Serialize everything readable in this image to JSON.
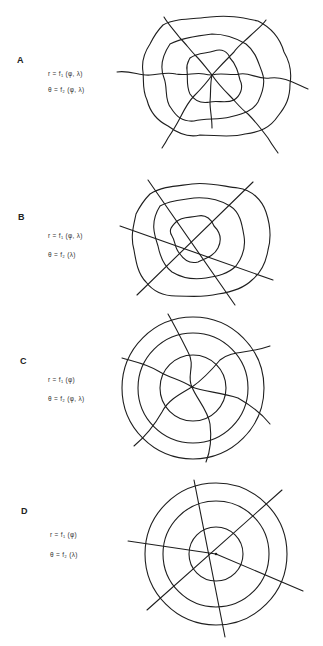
{
  "figure": {
    "panels": [
      {
        "id": "A",
        "label": "A",
        "formula_r": "r = f₁ (φ, λ)",
        "formula_theta": "θ = f₂ (φ, λ)",
        "description": "Both radius and angle depend on latitude and longitude: wavy rings and wavy radial lines"
      },
      {
        "id": "B",
        "label": "B",
        "formula_r": "r = f₁ (φ, λ)",
        "formula_theta": "θ = f₂ (λ)",
        "description": "Radius depends on latitude and longitude, angle on longitude only: wavy rings, straight radial lines"
      },
      {
        "id": "C",
        "label": "C",
        "formula_r": "r = f₁ (φ)",
        "formula_theta": "θ = f₂ (φ, λ)",
        "description": "Radius depends on latitude only, angle on latitude and longitude: concentric circles, curved (spiral) radial lines"
      },
      {
        "id": "D",
        "label": "D",
        "formula_r": "r = f₁ (φ)",
        "formula_theta": "θ = f₂ (λ)",
        "description": "Radius depends on latitude only, angle on longitude only: concentric circles, straight radial lines"
      }
    ]
  }
}
